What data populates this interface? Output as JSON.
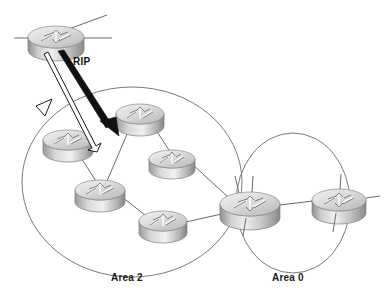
{
  "diagram": {
    "background": "#ffffff",
    "width": 391,
    "height": 305,
    "link_color": "#6b6b6b",
    "outline_color": "#7a7a7a",
    "arrow_fill": "#111111",
    "labels": {
      "protocol": "RIP",
      "area_two": "Area 2",
      "area_zero": "Area 0"
    },
    "areas": [
      {
        "id": "area-2",
        "label": "Area 2",
        "cx": 132,
        "cy": 182,
        "rx": 110,
        "ry": 95,
        "label_x": 113,
        "label_y": 281
      },
      {
        "id": "area-0",
        "label": "Area 0",
        "cx": 293,
        "cy": 203,
        "rx": 57,
        "ry": 70,
        "label_x": 274,
        "label_y": 281
      }
    ],
    "routers": [
      {
        "id": "router-external-top",
        "cx": 56,
        "cy": 37,
        "rx": 28,
        "ry": 11,
        "h": 13,
        "area": "external"
      },
      {
        "id": "router-area2-nw",
        "cx": 68,
        "cy": 140,
        "rx": 25,
        "ry": 10,
        "h": 12,
        "area": "area-2"
      },
      {
        "id": "router-area2-n",
        "cx": 140,
        "cy": 114,
        "rx": 24,
        "ry": 10,
        "h": 12,
        "area": "area-2"
      },
      {
        "id": "router-area2-e",
        "cx": 172,
        "cy": 159,
        "rx": 23,
        "ry": 9,
        "h": 11,
        "area": "area-2"
      },
      {
        "id": "router-area2-c",
        "cx": 100,
        "cy": 190,
        "rx": 25,
        "ry": 10,
        "h": 12,
        "area": "area-2"
      },
      {
        "id": "router-area2-s",
        "cx": 163,
        "cy": 221,
        "rx": 24,
        "ry": 10,
        "h": 12,
        "area": "area-2"
      },
      {
        "id": "router-abr",
        "cx": 250,
        "cy": 205,
        "rx": 30,
        "ry": 12,
        "h": 14,
        "area": "border"
      },
      {
        "id": "router-area0-e",
        "cx": 339,
        "cy": 200,
        "rx": 27,
        "ry": 11,
        "h": 13,
        "area": "area-0"
      }
    ],
    "links": [
      {
        "id": "link-ext-left",
        "from": "router-external-top",
        "x1": 14,
        "y1": 38,
        "x2": 30,
        "y2": 38
      },
      {
        "id": "link-ext-right",
        "from": "router-external-top",
        "x1": 82,
        "y1": 38,
        "x2": 110,
        "y2": 38
      },
      {
        "id": "link-ext-diag",
        "from": "router-external-top",
        "x1": 70,
        "y1": 29,
        "x2": 105,
        "y2": 16
      },
      {
        "id": "link-nw-c",
        "from": "router-area2-nw",
        "to": "router-area2-c",
        "x1": 76,
        "y1": 150,
        "x2": 96,
        "y2": 181
      },
      {
        "id": "link-n-c",
        "from": "router-area2-n",
        "to": "router-area2-c",
        "x1": 131,
        "y1": 125,
        "x2": 106,
        "y2": 181
      },
      {
        "id": "link-n-e",
        "from": "router-area2-n",
        "to": "router-area2-e",
        "x1": 151,
        "y1": 124,
        "x2": 168,
        "y2": 150
      },
      {
        "id": "link-e-abr",
        "from": "router-area2-e",
        "to": "router-abr",
        "x1": 193,
        "y1": 163,
        "x2": 228,
        "y2": 196
      },
      {
        "id": "link-c-s",
        "from": "router-area2-c",
        "to": "router-area2-s",
        "x1": 122,
        "y1": 197,
        "x2": 146,
        "y2": 216
      },
      {
        "id": "link-s-abr",
        "from": "router-area2-s",
        "to": "router-abr",
        "x1": 185,
        "y1": 221,
        "x2": 224,
        "y2": 212
      },
      {
        "id": "link-abr-east",
        "from": "router-abr",
        "to": "router-area0-e",
        "x1": 279,
        "y1": 204,
        "x2": 313,
        "y2": 200
      }
    ],
    "arrows": [
      {
        "id": "arrow-rip-solid",
        "style": "filled",
        "label": "RIP",
        "x1": 62,
        "y1": 52,
        "x2": 116,
        "y2": 132
      },
      {
        "id": "arrow-rip-outline",
        "style": "outline",
        "label": "",
        "x1": 48,
        "y1": 52,
        "x2": 100,
        "y2": 146
      }
    ],
    "protocol_label_pos": {
      "x": 73,
      "y": 63
    }
  }
}
